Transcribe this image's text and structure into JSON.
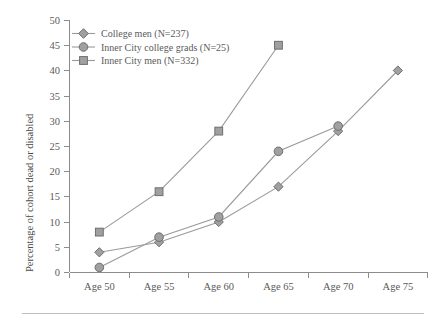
{
  "chart_data": {
    "type": "line",
    "title": "",
    "xlabel": "",
    "ylabel": "Percentage of cohort dead or disabled",
    "categories": [
      "Age 50",
      "Age 55",
      "Age 60",
      "Age 65",
      "Age 70",
      "Age 75"
    ],
    "yticks": [
      0,
      5,
      10,
      15,
      20,
      25,
      30,
      35,
      40,
      45,
      50
    ],
    "ylim": [
      0,
      50
    ],
    "grid": false,
    "legend_position": "top-left",
    "series": [
      {
        "name": "College men (N=237)",
        "marker": "diamond",
        "color": "#a0a0a0",
        "values": [
          4,
          6,
          10,
          17,
          28,
          40
        ]
      },
      {
        "name": "Inner City college grads (N=25)",
        "marker": "circle",
        "color": "#a0a0a0",
        "values": [
          1,
          7,
          11,
          24,
          29,
          null
        ]
      },
      {
        "name": "Inner City men (N=332)",
        "marker": "square",
        "color": "#a0a0a0",
        "values": [
          8,
          16,
          28,
          45,
          null,
          null
        ]
      }
    ]
  },
  "axis": {
    "y_title": "Percentage of cohort dead or disabled",
    "y_tick_labels": [
      "50",
      "45",
      "40",
      "35",
      "30",
      "25",
      "20",
      "15",
      "10",
      "5",
      "0"
    ],
    "x_tick_labels": [
      "Age 50",
      "Age 55",
      "Age 60",
      "Age 65",
      "Age 70",
      "Age 75"
    ]
  },
  "legend": {
    "items": [
      {
        "label": "College men (N=237)",
        "marker": "diamond-marker-icon"
      },
      {
        "label": "Inner City college grads (N=25)",
        "marker": "circle-marker-icon"
      },
      {
        "label": "Inner City men (N=332)",
        "marker": "square-marker-icon"
      }
    ]
  },
  "colors": {
    "line": "#9a9a9a",
    "marker_fill": "#a0a0a0",
    "marker_stroke": "#6e6e6e",
    "axis": "#8c8c8c",
    "text": "#5a5a5a",
    "rule": "#bdbdbd"
  }
}
